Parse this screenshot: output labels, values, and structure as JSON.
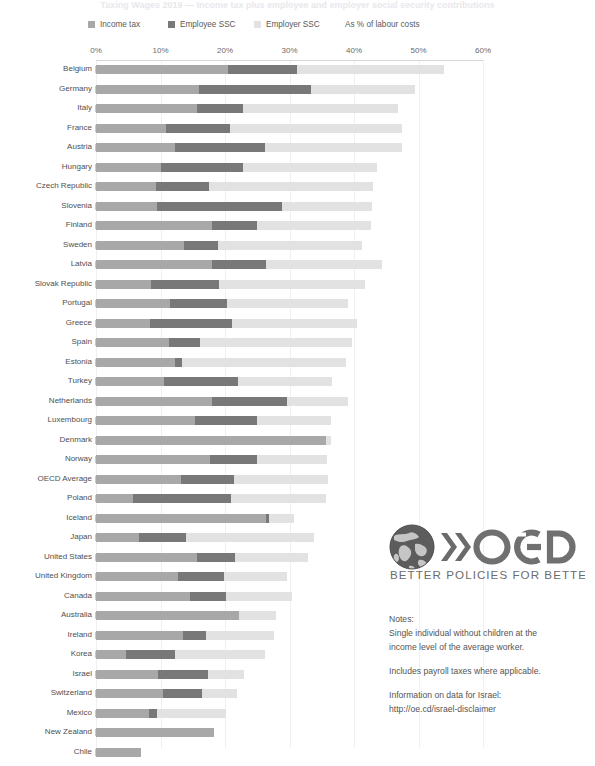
{
  "title": "Taxing Wages 2019 — Income tax plus employee and employer social security contributions",
  "legend": {
    "items": [
      {
        "label": "Income tax",
        "key": "income",
        "color": "#a8a8a8"
      },
      {
        "label": "Employee SSC",
        "key": "employee",
        "color": "#787878"
      },
      {
        "label": "Employer SSC",
        "key": "employer",
        "color": "#e2e2e2"
      }
    ],
    "note": "As % of labour costs"
  },
  "chart_data": {
    "type": "bar",
    "orientation": "horizontal",
    "stacked": true,
    "title": "Taxing Wages 2019 — Income tax plus employee and employer social security contributions",
    "xlabel": "As % of labour costs",
    "ylabel": "",
    "xlim": [
      0,
      60
    ],
    "xticks": [
      0,
      10,
      20,
      30,
      40,
      50,
      60
    ],
    "xtick_labels": [
      "0%",
      "10%",
      "20%",
      "30%",
      "40%",
      "50%",
      "60%"
    ],
    "grid": true,
    "legend_position": "top",
    "series": [
      {
        "name": "Income tax",
        "color": "#a8a8a8",
        "values": [
          20.4,
          16.0,
          15.6,
          10.8,
          12.2,
          10.0,
          9.3,
          9.4,
          18.0,
          13.6,
          18.0,
          8.5,
          11.4,
          8.3,
          11.3,
          12.2,
          10.5,
          18.0,
          15.4,
          35.7,
          17.7,
          13.2,
          5.7,
          26.4,
          6.6,
          15.6,
          12.7,
          14.6,
          22.2,
          13.5,
          4.7,
          9.6,
          10.4,
          8.2,
          18.3,
          7.0
        ]
      },
      {
        "name": "Employee SSC",
        "color": "#787878",
        "values": [
          10.8,
          17.3,
          7.2,
          10.0,
          14.0,
          12.8,
          8.2,
          19.5,
          7.0,
          5.3,
          8.4,
          10.5,
          8.9,
          12.8,
          4.9,
          1.2,
          11.5,
          11.6,
          9.5,
          0.0,
          7.3,
          8.2,
          15.3,
          0.4,
          7.4,
          5.9,
          7.1,
          5.6,
          0.0,
          3.6,
          7.5,
          7.7,
          6.0,
          1.2,
          0.0,
          0.0
        ]
      },
      {
        "name": "Employer SSC",
        "color": "#e2e2e2",
        "values": [
          22.7,
          16.2,
          24.0,
          26.6,
          21.3,
          20.8,
          25.4,
          13.9,
          17.6,
          22.3,
          17.9,
          22.7,
          18.7,
          19.4,
          23.5,
          25.3,
          14.6,
          9.4,
          11.6,
          0.8,
          10.8,
          14.6,
          14.7,
          3.9,
          19.8,
          11.4,
          9.8,
          10.2,
          5.7,
          10.5,
          14.0,
          5.7,
          5.5,
          10.8,
          0.0,
          0.0
        ]
      },
      {
        "name": "Total",
        "color": "",
        "values": [
          53.9,
          49.5,
          46.8,
          47.4,
          47.5,
          43.6,
          42.9,
          42.8,
          42.6,
          41.2,
          44.3,
          41.7,
          39.0,
          40.5,
          39.7,
          38.7,
          36.6,
          39.0,
          36.5,
          36.5,
          35.8,
          36.0,
          35.7,
          30.7,
          33.8,
          32.9,
          29.6,
          30.4,
          27.9,
          27.6,
          26.2,
          23.0,
          21.9,
          20.2,
          18.3,
          7.0
        ]
      }
    ],
    "categories": [
      "Belgium",
      "Germany",
      "Italy",
      "France",
      "Austria",
      "Hungary",
      "Czech Republic",
      "Slovenia",
      "Finland",
      "Sweden",
      "Latvia",
      "Slovak Republic",
      "Portugal",
      "Greece",
      "Spain",
      "Estonia",
      "Turkey",
      "Netherlands",
      "Luxembourg",
      "Denmark",
      "Norway",
      "OECD Average",
      "Poland",
      "Iceland",
      "Japan",
      "United States",
      "United Kingdom",
      "Canada",
      "Australia",
      "Ireland",
      "Korea",
      "Israel",
      "Switzerland",
      "Mexico",
      "New Zealand",
      "Chile"
    ]
  },
  "brand": {
    "name": "OECD",
    "tagline": "BETTER POLICIES FOR BETTER LIVES"
  },
  "notes": {
    "heading": "Notes:",
    "line1": "Single individual without children at the",
    "line2": "income level of the average worker.",
    "line3": "Includes payroll taxes where applicable.",
    "line4": "Information on data for Israel:",
    "link": "http://oe.cd/israel-disclaimer"
  }
}
